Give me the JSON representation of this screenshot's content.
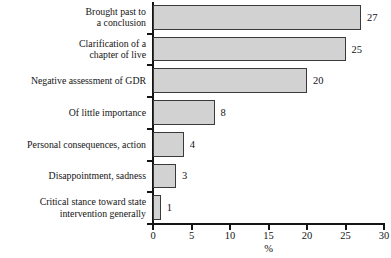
{
  "chart_data": {
    "type": "bar",
    "orientation": "horizontal",
    "title": "",
    "subtitle": "",
    "xlabel": "%",
    "ylabel": "",
    "xlim": [
      0,
      30
    ],
    "xticks": [
      0,
      5,
      10,
      15,
      20,
      25,
      30
    ],
    "xtick_labels": [
      "0",
      "5",
      "10",
      "15",
      "20",
      "25",
      "30"
    ],
    "grid": false,
    "legend": false,
    "categories": [
      "Brought past to\na conclusion",
      "Clarification of a\nchapter of live",
      "Negative assessment of GDR",
      "Of little importance",
      "Personal consequences, action",
      "Disappointment, sadness",
      "Critical stance toward state\nintervention generally"
    ],
    "values": [
      27,
      25,
      20,
      8,
      4,
      3,
      1
    ],
    "value_labels": [
      "27",
      "25",
      "20",
      "8",
      "4",
      "3",
      "1"
    ],
    "colors": {
      "bar_fill": "#d2d2d2",
      "bar_border": "#3a3a3a",
      "axis": "#141414",
      "text": "#141414",
      "background": "#ffffff"
    }
  }
}
